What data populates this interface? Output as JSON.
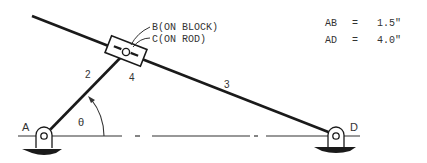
{
  "diagram": {
    "type": "mechanism linkage",
    "labels": {
      "point_a": "A",
      "point_d": "D",
      "point_b": "B(ON BLOCK)",
      "point_c": "C(ON ROD)",
      "link_2": "2",
      "link_3": "3",
      "link_4": "4",
      "angle": "θ"
    },
    "dimensions": [
      {
        "name": "AB",
        "eq": "=",
        "value": "1.5\""
      },
      {
        "name": "AD",
        "eq": "=",
        "value": "4.0\""
      }
    ],
    "colors": {
      "ink": "#1a1a1a",
      "text": "#333333",
      "background": "#ffffff"
    }
  }
}
